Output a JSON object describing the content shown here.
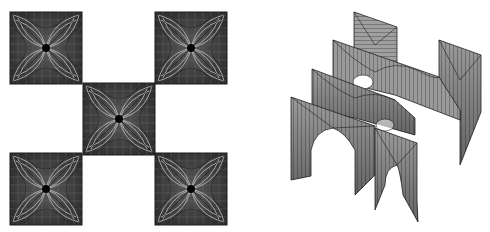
{
  "figure": {
    "left": {
      "description": "Top view: checkerboard arrangement of five square tiles with four-petal ruled-surface patterns",
      "tiles": [
        {
          "name": "tile-top-left",
          "x": 10,
          "y": 12,
          "size": 72
        },
        {
          "name": "tile-top-right",
          "x": 155,
          "y": 12,
          "size": 72
        },
        {
          "name": "tile-center",
          "x": 83,
          "y": 83,
          "size": 72
        },
        {
          "name": "tile-bottom-left",
          "x": 10,
          "y": 153,
          "size": 72
        },
        {
          "name": "tile-bottom-right",
          "x": 155,
          "y": 153,
          "size": 72
        }
      ],
      "colors": {
        "tile_fill": "#3a3a3a",
        "petal_line": "#d8d8d8",
        "grid_line": "#6a6a6a",
        "center_dot": "#050505"
      }
    },
    "right": {
      "description": "Axonometric view: staggered vaulted panels with arched openings forming a 3D lattice",
      "colors": {
        "panel_fill": "#8f8f8f",
        "panel_shade": "#5a5a5a",
        "line": "#2a2a2a"
      }
    }
  }
}
